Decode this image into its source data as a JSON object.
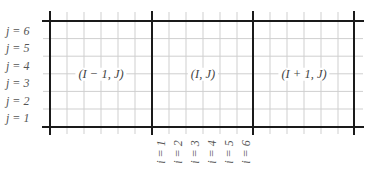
{
  "diagram": {
    "type": "staggered grid / control volume stencil",
    "colors": {
      "heavy_line": "#1a1a1a",
      "thin_line": "#cfcfcf",
      "text": "#555555"
    },
    "coarse_cells": [
      {
        "label": "(I − 1, J)"
      },
      {
        "label": "(I, J)"
      },
      {
        "label": "(I + 1, J)"
      }
    ],
    "subdivisions_per_cell": 6,
    "row_labels": [
      "j = 6",
      "j = 5",
      "j = 4",
      "j = 3",
      "j = 2",
      "j = 1"
    ],
    "col_labels": [
      "i = 1",
      "i = 2",
      "i = 3",
      "i = 4",
      "i = 5",
      "i = 6"
    ]
  }
}
